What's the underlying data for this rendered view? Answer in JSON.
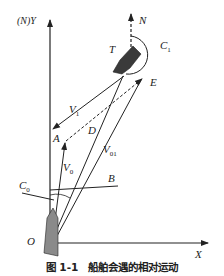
{
  "figure": {
    "caption": "图 1-1　船舶会遇的相对运动",
    "labels": {
      "y_axis": "(N)Y",
      "x_axis": "X",
      "north": "N",
      "target_ship": "T",
      "c1_main": "C",
      "c1_sub": "1",
      "c0_main": "C",
      "c0_sub": "0",
      "v1_main": "V",
      "v1_sub": "1",
      "v0_main": "V",
      "v0_sub": "0",
      "v01_main": "V",
      "v01_sub": "01",
      "point_a": "A",
      "point_b": "B",
      "point_d": "D",
      "point_e": "E",
      "origin": "O"
    },
    "colors": {
      "line": "#222222",
      "ship_o": "#8a8a8a",
      "ship_t": "#3a3a3a"
    }
  }
}
